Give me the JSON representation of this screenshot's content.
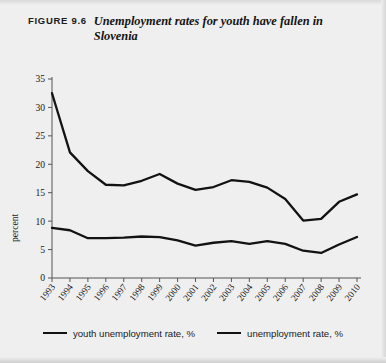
{
  "figure": {
    "label": "FIGURE 9.6",
    "title": "Unemployment rates for youth have fallen in Slovenia"
  },
  "legend": {
    "items": [
      {
        "label": "youth unemployment rate, %"
      },
      {
        "label": "unemployment rate, %"
      }
    ]
  },
  "chart_data": {
    "type": "line",
    "title": "Unemployment rates for youth have fallen in Slovenia",
    "xlabel": "",
    "ylabel": "percent",
    "ylim": [
      0,
      35
    ],
    "yticks": [
      0,
      5,
      10,
      15,
      20,
      25,
      30,
      35
    ],
    "grid": false,
    "legend_position": "bottom",
    "categories": [
      "1993",
      "1994",
      "1995",
      "1996",
      "1997",
      "1998",
      "1999",
      "2000",
      "2001",
      "2002",
      "2003",
      "2004",
      "2005",
      "2006",
      "2007",
      "2008",
      "2009",
      "2010"
    ],
    "series": [
      {
        "name": "youth unemployment rate, %",
        "color": "#121212",
        "values": [
          32.5,
          22.1,
          18.8,
          16.4,
          16.3,
          17.1,
          18.3,
          16.6,
          15.5,
          16.0,
          17.2,
          16.9,
          15.9,
          13.9,
          10.1,
          10.4,
          13.4,
          14.7
        ]
      },
      {
        "name": "unemployment rate, %",
        "color": "#121212",
        "values": [
          8.8,
          8.4,
          7.0,
          7.0,
          7.1,
          7.3,
          7.2,
          6.6,
          5.7,
          6.2,
          6.5,
          6.0,
          6.5,
          6.0,
          4.8,
          4.4,
          5.9,
          7.2
        ]
      }
    ]
  }
}
